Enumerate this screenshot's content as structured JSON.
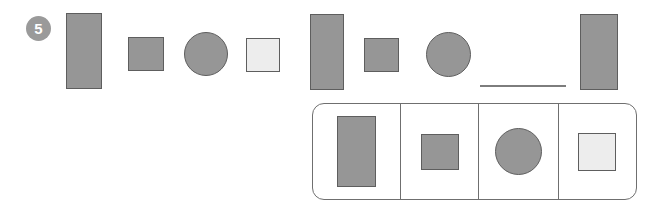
{
  "question": {
    "number": "5",
    "badge_color": "#9a9a9a"
  },
  "colors": {
    "shape_dark": "#969696",
    "shape_light": "#ededed",
    "shape_outline": "#5e5e5e",
    "box_outline": "#6f6f6f",
    "blank_line": "#7d7d7d",
    "background": "#ffffff"
  },
  "pattern_row": {
    "items": [
      {
        "name": "tall-rectangle",
        "shape": "rect",
        "fill": "dark",
        "x": 66,
        "y": 13,
        "w": 36,
        "h": 76
      },
      {
        "name": "small-square",
        "shape": "square",
        "fill": "dark",
        "x": 128,
        "y": 37,
        "w": 36,
        "h": 34
      },
      {
        "name": "circle",
        "shape": "circle",
        "fill": "dark",
        "x": 184,
        "y": 32,
        "w": 44,
        "h": 44
      },
      {
        "name": "light-square",
        "shape": "square",
        "fill": "light",
        "x": 246,
        "y": 38,
        "w": 34,
        "h": 34
      },
      {
        "name": "tall-rectangle",
        "shape": "rect",
        "fill": "dark",
        "x": 310,
        "y": 14,
        "w": 34,
        "h": 76
      },
      {
        "name": "small-square",
        "shape": "square",
        "fill": "dark",
        "x": 364,
        "y": 38,
        "w": 35,
        "h": 34
      },
      {
        "name": "circle",
        "shape": "circle",
        "fill": "dark",
        "x": 426,
        "y": 32,
        "w": 45,
        "h": 45
      },
      {
        "name": "answer-blank",
        "shape": "blank",
        "fill": "none",
        "x": 480,
        "y": 85,
        "w": 86,
        "h": 2
      },
      {
        "name": "tall-rectangle",
        "shape": "rect",
        "fill": "dark",
        "x": 580,
        "y": 14,
        "w": 38,
        "h": 76
      }
    ]
  },
  "options_box": {
    "x": 312,
    "y": 103,
    "w": 325,
    "h": 97,
    "cells": [
      {
        "name": "option-tall-rectangle",
        "shape": "rect",
        "fill": "dark",
        "cell_w": 88,
        "w": 39,
        "h": 71
      },
      {
        "name": "option-small-square",
        "shape": "square",
        "fill": "dark",
        "cell_w": 78,
        "w": 38,
        "h": 36
      },
      {
        "name": "option-circle",
        "shape": "circle",
        "fill": "dark",
        "cell_w": 80,
        "w": 47,
        "h": 47
      },
      {
        "name": "option-light-square",
        "shape": "square",
        "fill": "light",
        "cell_w": 76,
        "w": 38,
        "h": 38
      }
    ]
  }
}
